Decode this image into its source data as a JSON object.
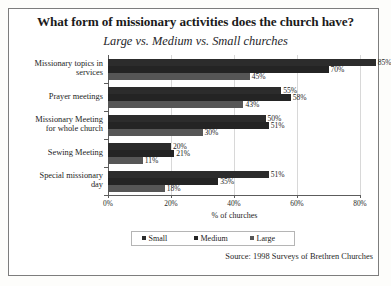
{
  "chart_data": {
    "type": "bar",
    "orientation": "horizontal",
    "title": "What form of missionary activities does the church have?",
    "subtitle": "Large vs. Medium vs. Small churches",
    "xlabel": "% of churches",
    "ylabel": "",
    "xlim": [
      0,
      80
    ],
    "grid": true,
    "legend_position": "bottom",
    "source": "Source: 1998 Surveys of Brethren Churches",
    "xticks": [
      "0%",
      "20%",
      "40%",
      "60%",
      "80%"
    ],
    "xtick_values": [
      0,
      20,
      40,
      60,
      80
    ],
    "categories": [
      "Missionary topics in services",
      "Prayer meetings",
      "Missionary Meeting for whole church",
      "Sewing Meeting",
      "Special missionary day"
    ],
    "series": [
      {
        "name": "Small",
        "color": "#2c2c2c",
        "values": [
          85,
          55,
          50,
          20,
          51
        ],
        "labels": [
          "85%",
          "55%",
          "50%",
          "20%",
          "51%"
        ]
      },
      {
        "name": "Medium",
        "color": "#242424",
        "values": [
          70,
          58,
          51,
          21,
          35
        ],
        "labels": [
          "70%",
          "58%",
          "51%",
          "21%",
          "35%"
        ]
      },
      {
        "name": "Large",
        "color": "#565656",
        "values": [
          45,
          43,
          30,
          11,
          18
        ],
        "labels": [
          "45%",
          "43%",
          "30%",
          "11%",
          "18%"
        ]
      }
    ]
  },
  "category_lines": {
    "c0": [
      "Missionary topics in",
      "services"
    ],
    "c1": [
      "Prayer meetings"
    ],
    "c2": [
      "Missionary Meeting",
      "for whole church"
    ],
    "c3": [
      "Sewing Meeting"
    ],
    "c4": [
      "Special missionary",
      "day"
    ]
  }
}
